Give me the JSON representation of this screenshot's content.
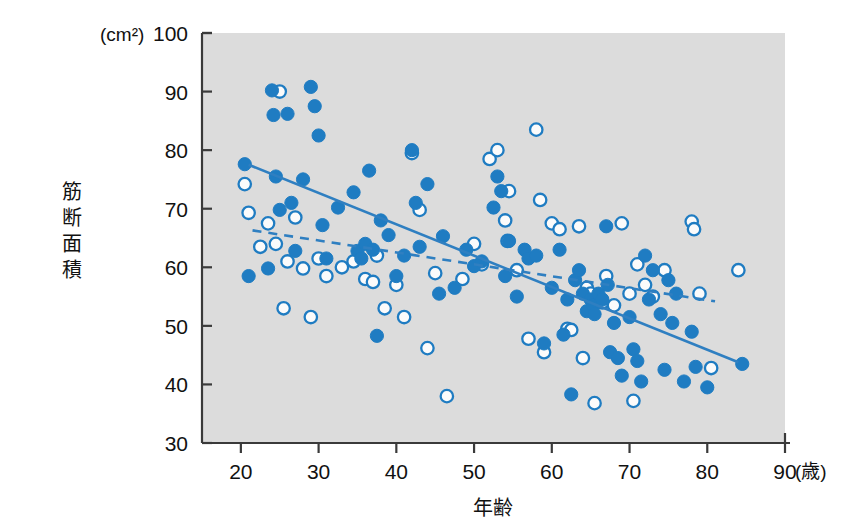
{
  "chart_data": {
    "type": "scatter",
    "title": "",
    "xlabel": "年齢",
    "ylabel": "筋断面積",
    "x_unit": "(歳)",
    "y_unit": "(cm²)",
    "xlim": [
      15,
      90
    ],
    "ylim": [
      30,
      100
    ],
    "xticks": [
      20,
      30,
      40,
      50,
      60,
      70,
      80,
      90
    ],
    "yticks": [
      30,
      40,
      50,
      60,
      70,
      80,
      90,
      100
    ],
    "grid": false,
    "legend": "none",
    "plot_background": "#dcdcdc",
    "marker_color": "#1f7cc2",
    "series": [
      {
        "name": "男性",
        "marker": "filled-circle",
        "points": [
          [
            20.5,
            77.6
          ],
          [
            21.0,
            58.5
          ],
          [
            23.5,
            59.8
          ],
          [
            24.0,
            90.2
          ],
          [
            24.2,
            86.0
          ],
          [
            24.5,
            75.5
          ],
          [
            25.0,
            69.8
          ],
          [
            26.0,
            86.2
          ],
          [
            26.5,
            71.0
          ],
          [
            27.0,
            62.8
          ],
          [
            28.0,
            75.0
          ],
          [
            29.0,
            90.8
          ],
          [
            29.5,
            87.5
          ],
          [
            30.0,
            82.5
          ],
          [
            30.5,
            67.2
          ],
          [
            31.0,
            61.5
          ],
          [
            32.5,
            70.2
          ],
          [
            34.5,
            72.8
          ],
          [
            35.0,
            62.8
          ],
          [
            35.5,
            61.5
          ],
          [
            36.0,
            64.0
          ],
          [
            36.5,
            76.5
          ],
          [
            37.0,
            63.0
          ],
          [
            37.5,
            48.3
          ],
          [
            38.0,
            68.0
          ],
          [
            39.0,
            65.5
          ],
          [
            40.0,
            58.5
          ],
          [
            41.0,
            62.0
          ],
          [
            42.0,
            80.0
          ],
          [
            42.5,
            71.0
          ],
          [
            43.0,
            63.5
          ],
          [
            44.0,
            74.2
          ],
          [
            45.5,
            55.5
          ],
          [
            46.0,
            65.3
          ],
          [
            47.5,
            56.5
          ],
          [
            49.0,
            63.0
          ],
          [
            50.0,
            60.2
          ],
          [
            51.0,
            61.0
          ],
          [
            52.5,
            70.2
          ],
          [
            53.0,
            75.5
          ],
          [
            53.5,
            73.0
          ],
          [
            54.0,
            58.5
          ],
          [
            54.5,
            64.5
          ],
          [
            55.5,
            55.0
          ],
          [
            56.5,
            63.0
          ],
          [
            57.0,
            61.5
          ],
          [
            58.0,
            62.0
          ],
          [
            59.0,
            47.0
          ],
          [
            60.0,
            56.5
          ],
          [
            61.0,
            63.0
          ],
          [
            61.5,
            48.5
          ],
          [
            62.0,
            54.5
          ],
          [
            62.5,
            38.3
          ],
          [
            63.0,
            57.8
          ],
          [
            63.5,
            59.5
          ],
          [
            64.0,
            55.5
          ],
          [
            64.5,
            52.5
          ],
          [
            65.0,
            54.5
          ],
          [
            65.3,
            53.5
          ],
          [
            65.5,
            52.0
          ],
          [
            66.0,
            55.5
          ],
          [
            66.5,
            54.5
          ],
          [
            67.0,
            67.0
          ],
          [
            67.2,
            57.0
          ],
          [
            67.5,
            45.5
          ],
          [
            68.0,
            50.5
          ],
          [
            68.5,
            44.5
          ],
          [
            69.0,
            41.5
          ],
          [
            70.0,
            51.5
          ],
          [
            70.5,
            46.0
          ],
          [
            71.0,
            44.0
          ],
          [
            71.5,
            40.5
          ],
          [
            72.0,
            62.0
          ],
          [
            72.5,
            54.5
          ],
          [
            73.0,
            59.5
          ],
          [
            74.0,
            52.0
          ],
          [
            74.5,
            42.5
          ],
          [
            75.0,
            57.8
          ],
          [
            75.5,
            50.5
          ],
          [
            76.0,
            55.5
          ],
          [
            77.0,
            40.5
          ],
          [
            78.0,
            49.0
          ],
          [
            78.5,
            43.0
          ],
          [
            80.0,
            39.5
          ],
          [
            84.5,
            43.5
          ]
        ]
      },
      {
        "name": "女性",
        "marker": "open-circle",
        "points": [
          [
            20.5,
            74.2
          ],
          [
            21.0,
            69.3
          ],
          [
            22.5,
            63.5
          ],
          [
            23.5,
            67.5
          ],
          [
            24.5,
            64.0
          ],
          [
            25.0,
            90.0
          ],
          [
            25.5,
            53.0
          ],
          [
            26.0,
            61.0
          ],
          [
            27.0,
            68.5
          ],
          [
            28.0,
            59.8
          ],
          [
            29.0,
            51.5
          ],
          [
            30.0,
            61.5
          ],
          [
            31.0,
            58.5
          ],
          [
            33.0,
            60.0
          ],
          [
            34.5,
            61.0
          ],
          [
            36.0,
            58.0
          ],
          [
            37.0,
            57.5
          ],
          [
            37.5,
            62.0
          ],
          [
            38.5,
            53.0
          ],
          [
            40.0,
            57.0
          ],
          [
            41.0,
            51.5
          ],
          [
            42.0,
            79.5
          ],
          [
            43.0,
            69.8
          ],
          [
            44.0,
            46.2
          ],
          [
            45.0,
            59.0
          ],
          [
            46.5,
            38.0
          ],
          [
            48.5,
            58.0
          ],
          [
            50.0,
            64.0
          ],
          [
            51.0,
            60.5
          ],
          [
            52.0,
            78.5
          ],
          [
            53.0,
            80.0
          ],
          [
            54.0,
            68.0
          ],
          [
            54.3,
            64.5
          ],
          [
            54.5,
            73.0
          ],
          [
            55.5,
            59.5
          ],
          [
            57.0,
            47.8
          ],
          [
            58.0,
            83.5
          ],
          [
            58.5,
            71.5
          ],
          [
            59.0,
            45.5
          ],
          [
            60.0,
            67.5
          ],
          [
            61.0,
            66.5
          ],
          [
            62.0,
            49.5
          ],
          [
            62.5,
            49.3
          ],
          [
            63.5,
            67.0
          ],
          [
            64.0,
            44.5
          ],
          [
            64.5,
            56.5
          ],
          [
            65.0,
            55.5
          ],
          [
            65.5,
            36.8
          ],
          [
            66.5,
            54.0
          ],
          [
            67.0,
            58.5
          ],
          [
            68.0,
            53.5
          ],
          [
            69.0,
            67.5
          ],
          [
            70.0,
            55.5
          ],
          [
            70.5,
            37.2
          ],
          [
            71.0,
            60.5
          ],
          [
            72.0,
            57.0
          ],
          [
            73.0,
            55.0
          ],
          [
            74.5,
            59.5
          ],
          [
            78.0,
            67.8
          ],
          [
            78.3,
            66.5
          ],
          [
            79.0,
            55.5
          ],
          [
            80.5,
            42.8
          ],
          [
            84.0,
            59.5
          ]
        ]
      }
    ],
    "trendlines": [
      {
        "name": "男性回帰直線",
        "style": "solid",
        "x_start": 21.0,
        "y_start": 77.5,
        "x_end": 84.0,
        "y_end": 43.8
      },
      {
        "name": "女性回帰直線",
        "style": "dashed",
        "x_start": 21.5,
        "y_start": 66.3,
        "x_end": 81.0,
        "y_end": 54.2
      }
    ]
  },
  "axes": {
    "y_unit_label": "(cm²)",
    "y_title": "筋断面積",
    "x_title": "年齢",
    "x_unit_label": "(歳)",
    "y_tick_labels": [
      "100",
      "90",
      "80",
      "70",
      "60",
      "50",
      "40",
      "30"
    ],
    "x_tick_labels": [
      "20",
      "30",
      "40",
      "50",
      "60",
      "70",
      "80",
      "90"
    ]
  }
}
